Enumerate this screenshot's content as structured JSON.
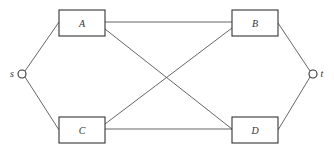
{
  "diagram": {
    "type": "network-graph",
    "nodes": {
      "source": {
        "label": "s",
        "cx": 22,
        "cy": 74
      },
      "sink": {
        "label": "t",
        "cx": 313,
        "cy": 74
      }
    },
    "boxes": [
      {
        "id": "A",
        "label": "A",
        "x": 59,
        "y": 10,
        "w": 46,
        "h": 26
      },
      {
        "id": "B",
        "label": "B",
        "x": 232,
        "y": 10,
        "w": 46,
        "h": 26
      },
      {
        "id": "C",
        "label": "C",
        "x": 59,
        "y": 117,
        "w": 46,
        "h": 26
      },
      {
        "id": "D",
        "label": "D",
        "x": 232,
        "y": 117,
        "w": 46,
        "h": 26
      }
    ],
    "edges": [
      {
        "from": "s",
        "to": "A"
      },
      {
        "from": "s",
        "to": "C"
      },
      {
        "from": "A",
        "to": "B"
      },
      {
        "from": "A",
        "to": "D"
      },
      {
        "from": "C",
        "to": "B"
      },
      {
        "from": "C",
        "to": "D"
      },
      {
        "from": "B",
        "to": "t"
      },
      {
        "from": "D",
        "to": "t"
      }
    ]
  }
}
